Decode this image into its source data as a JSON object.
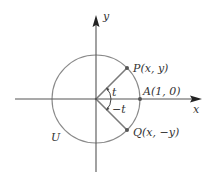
{
  "diagram": {
    "colors": {
      "axis": "#555555",
      "circle": "#8a8a8a",
      "radius": "#7a7a7a",
      "point": "#555555",
      "text": "#333333"
    },
    "labels": {
      "y_axis": "y",
      "x_axis": "x",
      "point_p": "P(x, y)",
      "point_a": "A(1, 0)",
      "point_q": "Q(x, −y)",
      "angle_pos": "t",
      "angle_neg": "−t",
      "circle_name": "U"
    }
  }
}
